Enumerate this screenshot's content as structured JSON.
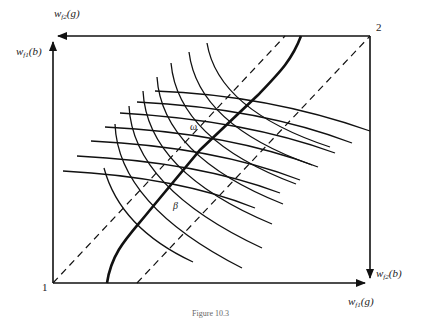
{
  "figure": {
    "type": "edgeworth-box",
    "caption": "Figure 10.3",
    "origins": {
      "origin_1": "1",
      "origin_2": "2"
    },
    "axes": {
      "top_left_up": {
        "base": "w",
        "sub": "f1",
        "arg": "(b)"
      },
      "top_left_left": {
        "base": "w",
        "sub": "f2",
        "arg": "(g)"
      },
      "bottom_right_right": {
        "base": "w",
        "sub": "f1",
        "arg": "(g)"
      },
      "bottom_right_down": {
        "base": "w",
        "sub": "f2",
        "arg": "(b)"
      }
    },
    "point_labels": {
      "omega": "ω",
      "beta": "β"
    },
    "elements": [
      "box-frame",
      "contract-curve (thick)",
      "upper dashed diagonal",
      "lower dashed diagonal",
      "indifference curves agent 1 (7)",
      "indifference curves agent 2 (8)"
    ]
  }
}
